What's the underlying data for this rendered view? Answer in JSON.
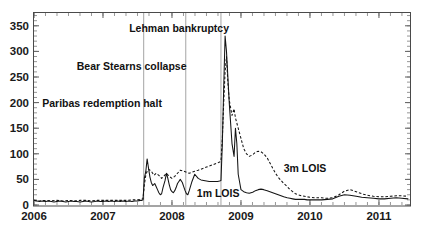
{
  "chart_data": {
    "type": "line",
    "title": "",
    "subtitle": "",
    "xlabel": "",
    "ylabel": "",
    "xlim": [
      2006.0,
      2011.45
    ],
    "ylim": [
      0,
      375
    ],
    "yticks": [
      0,
      50,
      100,
      150,
      200,
      250,
      300,
      350
    ],
    "ytick_labels": [
      "0",
      "50",
      "100",
      "150",
      "200",
      "250",
      "300",
      "350"
    ],
    "xticks": [
      2006,
      2007,
      2008,
      2009,
      2010,
      2011
    ],
    "xtick_labels": [
      "2006",
      "2007",
      "2008",
      "2009",
      "2010",
      "2011"
    ],
    "grid": false,
    "legend_position": "inline-annotations",
    "units": "basis points",
    "annotations": [
      {
        "id": "paribas",
        "label": "Paribas redemption halt",
        "text_x": 2006.12,
        "text_y": 200,
        "event_x": 2007.59,
        "line": true
      },
      {
        "id": "bear-stearns",
        "label": "Bear Stearns collapse",
        "text_x": 2006.62,
        "text_y": 272,
        "event_x": 2008.2,
        "line": true
      },
      {
        "id": "lehman",
        "label": "Lehman bankruptcy",
        "text_x": 2007.38,
        "text_y": 345,
        "event_x": 2008.71,
        "line": true
      }
    ],
    "series": [
      {
        "name": "1m LOIS",
        "style": "solid",
        "label_x": 2008.36,
        "label_y": 24,
        "x": [
          2006.0,
          2006.04,
          2006.08,
          2006.12,
          2006.17,
          2006.21,
          2006.25,
          2006.29,
          2006.33,
          2006.38,
          2006.42,
          2006.46,
          2006.5,
          2006.54,
          2006.58,
          2006.62,
          2006.67,
          2006.71,
          2006.75,
          2006.79,
          2006.83,
          2006.88,
          2006.92,
          2006.96,
          2007.0,
          2007.04,
          2007.08,
          2007.12,
          2007.17,
          2007.21,
          2007.25,
          2007.29,
          2007.33,
          2007.38,
          2007.42,
          2007.46,
          2007.5,
          2007.54,
          2007.56,
          2007.58,
          2007.6,
          2007.62,
          2007.64,
          2007.66,
          2007.68,
          2007.7,
          2007.72,
          2007.75,
          2007.77,
          2007.79,
          2007.81,
          2007.83,
          2007.85,
          2007.87,
          2007.9,
          2007.92,
          2007.94,
          2007.96,
          2007.98,
          2008.0,
          2008.02,
          2008.04,
          2008.06,
          2008.08,
          2008.1,
          2008.12,
          2008.15,
          2008.17,
          2008.19,
          2008.21,
          2008.23,
          2008.25,
          2008.29,
          2008.33,
          2008.38,
          2008.42,
          2008.46,
          2008.5,
          2008.54,
          2008.58,
          2008.62,
          2008.66,
          2008.69,
          2008.71,
          2008.73,
          2008.75,
          2008.77,
          2008.79,
          2008.81,
          2008.83,
          2008.85,
          2008.87,
          2008.9,
          2008.92,
          2008.94,
          2008.96,
          2009.0,
          2009.04,
          2009.08,
          2009.12,
          2009.17,
          2009.21,
          2009.25,
          2009.29,
          2009.33,
          2009.38,
          2009.42,
          2009.46,
          2009.5,
          2009.54,
          2009.58,
          2009.62,
          2009.67,
          2009.71,
          2009.75,
          2009.79,
          2009.83,
          2009.88,
          2009.92,
          2009.96,
          2010.0,
          2010.08,
          2010.17,
          2010.25,
          2010.33,
          2010.42,
          2010.5,
          2010.58,
          2010.67,
          2010.75,
          2010.83,
          2010.92,
          2011.0,
          2011.08,
          2011.17,
          2011.25,
          2011.33,
          2011.42
        ],
        "y": [
          9,
          8,
          7,
          8,
          7,
          8,
          7,
          6,
          7,
          8,
          7,
          6,
          7,
          8,
          7,
          7,
          6,
          7,
          8,
          7,
          6,
          7,
          8,
          7,
          7,
          8,
          7,
          8,
          7,
          8,
          7,
          8,
          7,
          8,
          7,
          8,
          8,
          9,
          9,
          10,
          53,
          65,
          90,
          72,
          55,
          44,
          38,
          42,
          36,
          30,
          24,
          20,
          22,
          34,
          48,
          62,
          52,
          40,
          30,
          26,
          24,
          28,
          34,
          42,
          46,
          50,
          44,
          36,
          28,
          22,
          20,
          28,
          46,
          60,
          52,
          49,
          48,
          47,
          46,
          46,
          46,
          46,
          47,
          48,
          120,
          230,
          330,
          300,
          250,
          200,
          160,
          120,
          95,
          150,
          120,
          60,
          30,
          26,
          24,
          23,
          25,
          28,
          30,
          31,
          30,
          28,
          26,
          24,
          22,
          20,
          18,
          16,
          14,
          13,
          12,
          11,
          11,
          11,
          11,
          10,
          10,
          10,
          10,
          11,
          12,
          17,
          20,
          19,
          17,
          15,
          14,
          13,
          12,
          12,
          13,
          14,
          13,
          12
        ]
      },
      {
        "name": "3m LOIS",
        "style": "dashed",
        "label_x": 2009.62,
        "label_y": 72,
        "x": [
          2006.0,
          2006.08,
          2006.17,
          2006.25,
          2006.33,
          2006.42,
          2006.5,
          2006.58,
          2006.67,
          2006.75,
          2006.83,
          2006.92,
          2007.0,
          2007.08,
          2007.17,
          2007.25,
          2007.33,
          2007.42,
          2007.5,
          2007.56,
          2007.58,
          2007.6,
          2007.62,
          2007.64,
          2007.66,
          2007.7,
          2007.74,
          2007.77,
          2007.81,
          2007.85,
          2007.88,
          2007.92,
          2007.96,
          2008.0,
          2008.04,
          2008.08,
          2008.12,
          2008.17,
          2008.21,
          2008.25,
          2008.29,
          2008.33,
          2008.38,
          2008.42,
          2008.46,
          2008.5,
          2008.54,
          2008.58,
          2008.62,
          2008.66,
          2008.69,
          2008.71,
          2008.73,
          2008.75,
          2008.77,
          2008.79,
          2008.81,
          2008.83,
          2008.85,
          2008.87,
          2008.9,
          2008.92,
          2008.96,
          2009.0,
          2009.04,
          2009.08,
          2009.12,
          2009.17,
          2009.21,
          2009.25,
          2009.29,
          2009.33,
          2009.38,
          2009.42,
          2009.46,
          2009.5,
          2009.54,
          2009.58,
          2009.62,
          2009.67,
          2009.71,
          2009.75,
          2009.79,
          2009.83,
          2009.88,
          2009.92,
          2009.96,
          2010.0,
          2010.08,
          2010.17,
          2010.25,
          2010.33,
          2010.42,
          2010.5,
          2010.58,
          2010.67,
          2010.75,
          2010.83,
          2010.92,
          2011.0,
          2011.08,
          2011.17,
          2011.25,
          2011.33,
          2011.42
        ],
        "y": [
          9,
          8,
          9,
          8,
          9,
          8,
          9,
          8,
          9,
          9,
          8,
          9,
          9,
          9,
          9,
          9,
          9,
          10,
          10,
          11,
          12,
          40,
          58,
          66,
          70,
          66,
          58,
          62,
          58,
          52,
          56,
          62,
          56,
          52,
          56,
          62,
          68,
          66,
          64,
          62,
          64,
          66,
          68,
          70,
          72,
          74,
          76,
          78,
          80,
          82,
          84,
          86,
          130,
          200,
          260,
          290,
          240,
          205,
          190,
          175,
          188,
          170,
          150,
          130,
          110,
          100,
          95,
          98,
          103,
          105,
          104,
          100,
          92,
          82,
          72,
          62,
          54,
          48,
          42,
          36,
          30,
          26,
          22,
          20,
          18,
          17,
          16,
          15,
          14,
          14,
          13,
          14,
          20,
          27,
          30,
          26,
          22,
          19,
          17,
          16,
          16,
          17,
          18,
          18,
          17
        ]
      }
    ]
  }
}
